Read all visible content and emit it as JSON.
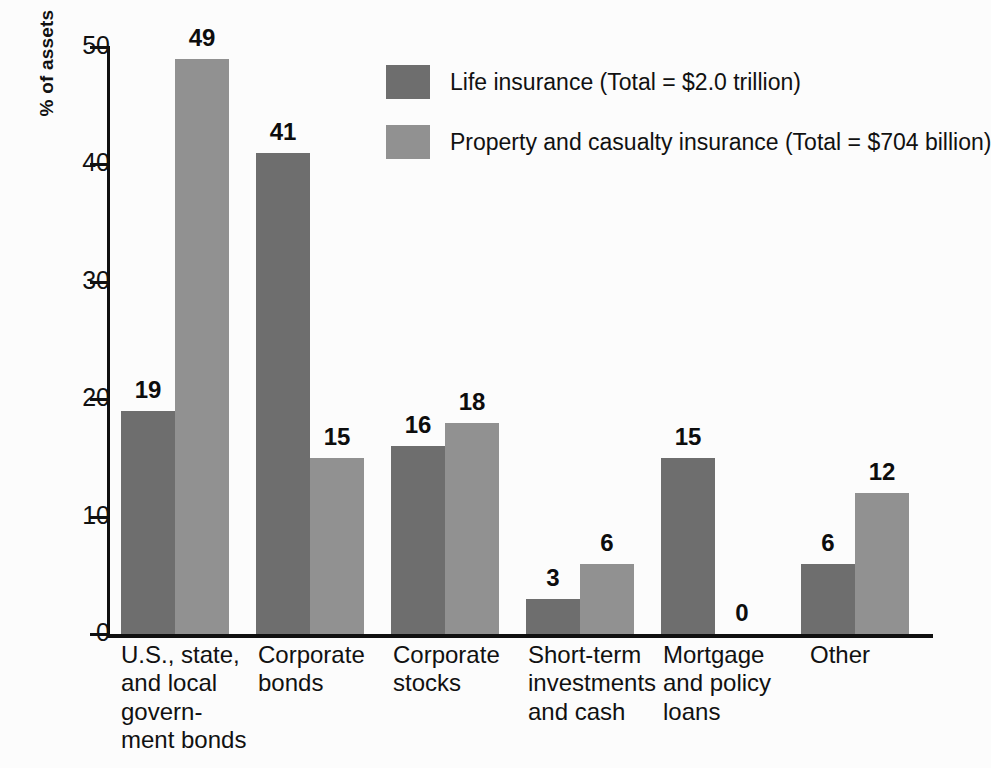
{
  "chart_data": {
    "type": "bar",
    "title": "",
    "subtitle": "",
    "xlabel": "",
    "ylabel": "% of assets",
    "ylim": [
      0,
      50
    ],
    "yticks": [
      0,
      10,
      20,
      30,
      40,
      50
    ],
    "ytick_labels": [
      "0",
      "10",
      "20",
      "30",
      "40",
      "50"
    ],
    "grid": false,
    "legend_position": "top-center-right",
    "categories": [
      "U.S., state,\nand local\ngovern-\nment bonds",
      "Corporate\nbonds",
      "Corporate\nstocks",
      "Short-term\ninvestments\nand cash",
      "Mortgage\nand policy\nloans",
      "Other"
    ],
    "series": [
      {
        "name": "Life insurance (Total = $2.0 trillion)",
        "color": "#6e6e6e",
        "values": [
          19,
          41,
          16,
          3,
          15,
          6
        ],
        "value_labels": [
          "19",
          "41",
          "16",
          "3",
          "15",
          "6"
        ]
      },
      {
        "name": "Property and casualty insurance (Total = $704 billion)",
        "color": "#919191",
        "values": [
          49,
          15,
          18,
          6,
          0,
          12
        ],
        "value_labels": [
          "49",
          "15",
          "18",
          "6",
          "0",
          "12"
        ]
      }
    ]
  },
  "legend": {
    "items": [
      {
        "label": "Life insurance (Total = $2.0 trillion)",
        "color": "#6e6e6e"
      },
      {
        "label": "Property and casualty insurance (Total = $704 billion)",
        "color": "#919191"
      }
    ]
  },
  "colors": {
    "background": "#fcfcfc",
    "axis": "#101010",
    "text": "#111111",
    "series_life": "#6e6e6e",
    "series_property": "#919191"
  }
}
